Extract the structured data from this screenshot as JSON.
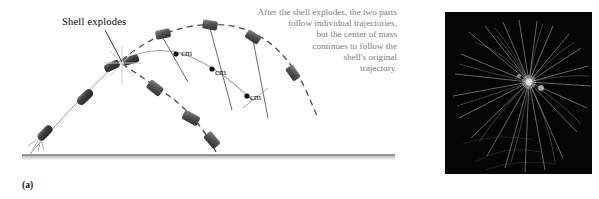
{
  "figure": {
    "panel_a": {
      "tag": "(a)",
      "callout_label": "Shell explodes",
      "annotation_lines": [
        "After the shell explodes, the two parts",
        "follow individual trajectories,",
        "but the center of mass",
        "continues to follow the",
        "shell's original",
        "trajectory."
      ],
      "cm_labels": [
        "cm",
        "cm",
        "cm"
      ],
      "colors": {
        "shell_body": "#4a4a4a",
        "fragment_body": "#5a5a5a",
        "trajectory_line": "#8c8c8c",
        "dashed_trajectory": "#4f4f4f",
        "cm_curve": "#9a9a9a",
        "ground_line": "#3c3c3c",
        "annotation_text": "#7c7c7c",
        "callout_text": "#000000"
      }
    },
    "panel_b": {
      "tag": "(b)",
      "photo_alt": "firework-burst-photograph",
      "colors": {
        "sky": "#050505",
        "sparks": "#e8e8e8"
      }
    }
  }
}
